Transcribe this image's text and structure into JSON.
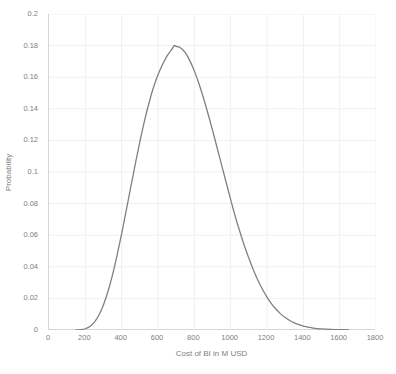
{
  "chart_data": {
    "type": "line",
    "title": "",
    "xlabel": "Cost of BI in M USD",
    "ylabel": "Probability",
    "xlim": [
      0,
      1800
    ],
    "ylim": [
      0,
      0.2
    ],
    "grid": true,
    "legend": "none",
    "line_color": "#808080",
    "xticks": [
      0,
      200,
      400,
      600,
      800,
      1000,
      1200,
      1400,
      1600,
      1800
    ],
    "xtick_labels": [
      "0",
      "200",
      "400",
      "600",
      "800",
      "1000",
      "1200",
      "1400",
      "1600",
      "1800"
    ],
    "yticks": [
      0,
      0.02,
      0.04,
      0.06,
      0.08,
      0.1,
      0.12,
      0.14,
      0.16,
      0.18,
      0.2
    ],
    "ytick_labels": [
      "0",
      "0.02",
      "0.04",
      "0.06",
      "0.08",
      "0.1",
      "0.12",
      "0.14",
      "0.16",
      "0.18",
      "0.2"
    ],
    "series": [
      {
        "name": "Probability density of Cost of BI",
        "x": [
          150,
          175,
          200,
          225,
          250,
          275,
          300,
          325,
          350,
          375,
          400,
          425,
          450,
          475,
          500,
          525,
          550,
          575,
          600,
          625,
          650,
          675,
          690,
          700,
          725,
          750,
          775,
          800,
          825,
          850,
          875,
          900,
          925,
          950,
          975,
          1000,
          1025,
          1050,
          1075,
          1100,
          1125,
          1150,
          1175,
          1200,
          1225,
          1250,
          1275,
          1300,
          1325,
          1350,
          1375,
          1400,
          1425,
          1450,
          1475,
          1500,
          1550,
          1600,
          1650
        ],
        "y": [
          0.0,
          0.0002,
          0.0008,
          0.0022,
          0.005,
          0.0095,
          0.016,
          0.0245,
          0.035,
          0.0475,
          0.061,
          0.0755,
          0.0905,
          0.105,
          0.119,
          0.132,
          0.1435,
          0.1535,
          0.1615,
          0.168,
          0.1735,
          0.1775,
          0.18,
          0.1795,
          0.1785,
          0.1755,
          0.1705,
          0.164,
          0.156,
          0.147,
          0.137,
          0.1265,
          0.1155,
          0.1045,
          0.0935,
          0.0825,
          0.072,
          0.0625,
          0.0535,
          0.0455,
          0.038,
          0.0315,
          0.0258,
          0.0208,
          0.0166,
          0.0131,
          0.0102,
          0.0079,
          0.006,
          0.0045,
          0.0034,
          0.0025,
          0.0018,
          0.0013,
          0.0009,
          0.0007,
          0.0004,
          0.0002,
          0.0001
        ],
        "peak_x": 690,
        "peak_y": 0.18
      }
    ]
  }
}
